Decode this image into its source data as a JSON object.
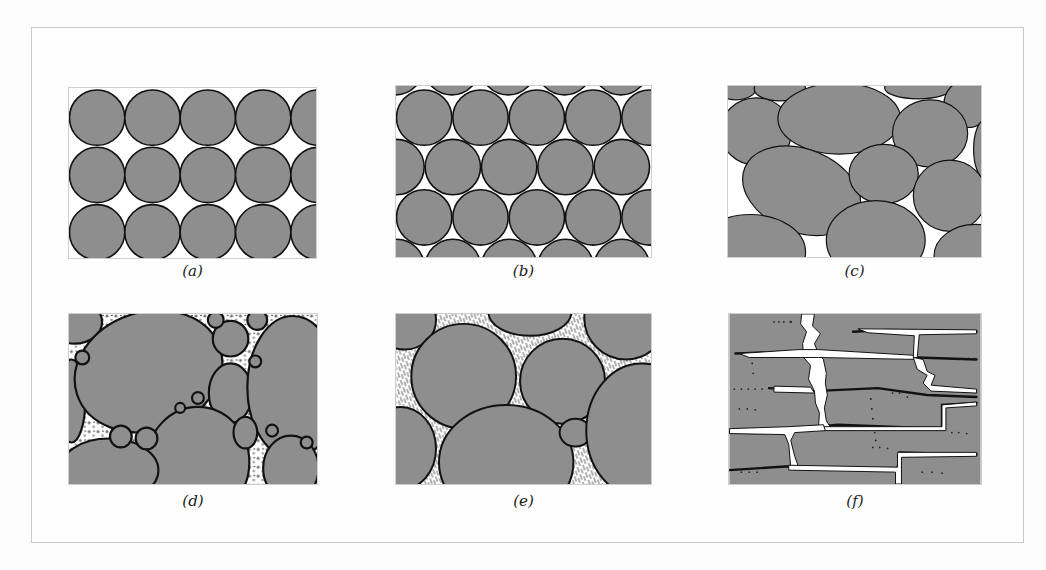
{
  "figure": {
    "colors": {
      "grain_fill": "#8e8e8e",
      "grain_outline": "#111111",
      "pore_space": "#ffffff",
      "frame_border": "#c9c9c9"
    },
    "panels": [
      {
        "id": "a",
        "label": "(a)",
        "content": "uniform spheres, cubic packing"
      },
      {
        "id": "b",
        "label": "(b)",
        "content": "uniform spheres, rhombohedral (hexagonal) packing"
      },
      {
        "id": "c",
        "label": "(c)",
        "content": "poorly sorted rounded grains"
      },
      {
        "id": "d",
        "label": "(d)",
        "content": "grains with fine porous matrix between"
      },
      {
        "id": "e",
        "label": "(e)",
        "content": "grains with pores partially filled by mineral cement"
      },
      {
        "id": "f",
        "label": "(f)",
        "content": "fractured rock with fracture porosity"
      }
    ]
  }
}
